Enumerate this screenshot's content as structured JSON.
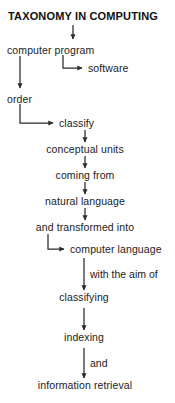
{
  "diagram": {
    "title": "TAXONOMY IN COMPUTING",
    "type": "flowchart",
    "orientation": "top-to-bottom",
    "background_color": "#fefefe",
    "line_color": "#2b2b2b",
    "text_color": "#1c1c1c",
    "nodes": [
      {
        "id": "computer_program",
        "label": "computer program"
      },
      {
        "id": "software",
        "label": "software"
      },
      {
        "id": "order",
        "label": "order"
      },
      {
        "id": "classify",
        "label": "classify"
      },
      {
        "id": "conceptual_units",
        "label": "conceptual units"
      },
      {
        "id": "coming_from",
        "label": "coming from"
      },
      {
        "id": "natural_language",
        "label": "natural language"
      },
      {
        "id": "and_transformed_into",
        "label": "and transformed into"
      },
      {
        "id": "computer_language",
        "label": "computer language"
      },
      {
        "id": "classifying",
        "label": "classifying"
      },
      {
        "id": "indexing",
        "label": "indexing"
      },
      {
        "id": "information_retrieval",
        "label": "information retrieval"
      }
    ],
    "edge_labels": [
      {
        "id": "with_the_aim_of",
        "label": "with the aim of"
      },
      {
        "id": "and",
        "label": "and"
      }
    ]
  }
}
